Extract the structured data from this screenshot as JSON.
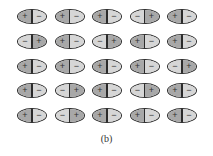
{
  "figure": {
    "caption": "(b)",
    "symbols": {
      "positive": "+",
      "negative": "−"
    },
    "colors": {
      "positive_fill": "#a8a8a8",
      "negative_fill": "#d6d6d6",
      "outline": "#2a2a2a"
    },
    "rows": [
      [
        "+-",
        "+-",
        "+-",
        "-+",
        "+-"
      ],
      [
        "-+",
        "+-",
        "-+",
        "+-",
        "+-"
      ],
      [
        "+-",
        "+-",
        "+-",
        "+-",
        "-+"
      ],
      [
        "+-",
        "-+",
        "+-",
        "-+",
        "+-"
      ],
      [
        "+-",
        "-+",
        "+-",
        "+-",
        "+-"
      ]
    ]
  }
}
